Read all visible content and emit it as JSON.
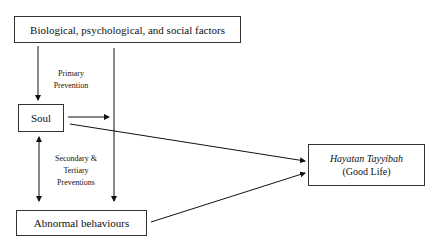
{
  "diagram": {
    "nodes": {
      "factors": "Biological, psychological, and social factors",
      "soul": "Soul",
      "abnormal": "Abnormal behaviours",
      "good_life_title": "Hayatan Tayyibah",
      "good_life_sub": "(Good Life)"
    },
    "labels": {
      "primary_1": "Primary",
      "primary_2": "Prevention",
      "secondary_1": "Secondary &",
      "secondary_2": "Tertiary",
      "secondary_3": "Preventions"
    }
  }
}
